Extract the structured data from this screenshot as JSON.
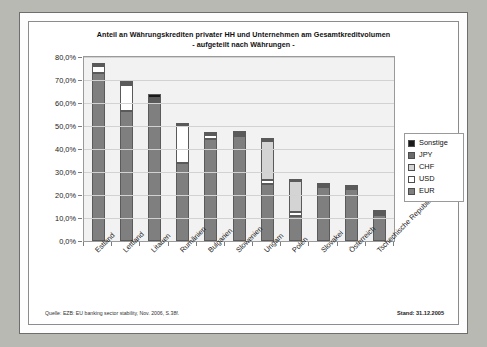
{
  "chart_data": {
    "type": "bar",
    "stacked": true,
    "title": "Anteil an Währungskrediten privater HH und Unternehmen am Gesamtkreditvolumen",
    "subtitle": "- aufgeteilt nach Währungen -",
    "xlabel": "",
    "ylabel": "",
    "ylim": [
      0,
      80
    ],
    "ytick_values": [
      0,
      10,
      20,
      30,
      40,
      50,
      60,
      70,
      80
    ],
    "ytick_labels": [
      "0,0%",
      "10,0%",
      "20,0%",
      "30,0%",
      "40,0%",
      "50,0%",
      "60,0%",
      "70,0%",
      "80,0%"
    ],
    "grid": true,
    "legend_position": "right-inside",
    "legend_order_top_to_bottom": [
      "Sonstige",
      "JPY",
      "CHF",
      "USD",
      "EUR"
    ],
    "categories": [
      "Estland",
      "Lettland",
      "Litauen",
      "Rumänien",
      "Bulgarien",
      "Slowenien",
      "Ungarn",
      "Polen",
      "Slovakei",
      "Österreich",
      "Tschechische Republik"
    ],
    "series": [
      {
        "name": "EUR",
        "color": "#7f7f7f",
        "values": [
          73.0,
          56.5,
          60.5,
          34.0,
          44.5,
          45.5,
          25.0,
          11.0,
          23.5,
          22.5,
          11.5
        ]
      },
      {
        "name": "USD",
        "color": "#ffffff",
        "values": [
          3.0,
          11.5,
          1.0,
          16.0,
          1.5,
          0.8,
          1.5,
          1.5,
          0.5,
          0.5,
          0.5
        ]
      },
      {
        "name": "CHF",
        "color": "#d4d4d4",
        "values": [
          0.3,
          0.4,
          0.5,
          0.3,
          0.3,
          0.4,
          17.0,
          13.5,
          0.3,
          0.3,
          0.3
        ]
      },
      {
        "name": "JPY",
        "color": "#6a6a6a",
        "values": [
          0.2,
          0.2,
          0.3,
          0.2,
          0.2,
          0.3,
          0.3,
          0.3,
          0.2,
          0.2,
          0.2
        ]
      },
      {
        "name": "Sonstige",
        "color": "#1a1a1a",
        "values": [
          0.5,
          0.4,
          1.7,
          0.5,
          0.5,
          0.5,
          0.7,
          0.2,
          0.5,
          0.5,
          0.5
        ]
      }
    ],
    "totals": [
      77.0,
      69.0,
      64.0,
      51.0,
      47.0,
      47.5,
      44.5,
      26.5,
      25.0,
      24.0,
      13.0
    ]
  },
  "footer": {
    "source": "Quelle: EZB: EU banking sector stability, Nov. 2006, S.38f.",
    "stand": "Stand: 31.12.2005"
  }
}
